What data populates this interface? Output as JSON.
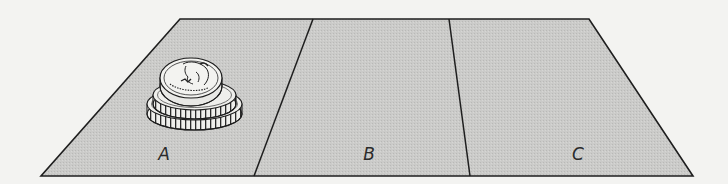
{
  "figure": {
    "colors": {
      "background": "#f3f3f1",
      "mat_fill": "#c9c9c7",
      "outline": "#1e1e1e",
      "coin_face": "#f2f2ef",
      "coin_edge": "#e6e6e2"
    },
    "regions": [
      {
        "id": "A",
        "label": "A",
        "has_coins": true
      },
      {
        "id": "B",
        "label": "B",
        "has_coins": false
      },
      {
        "id": "C",
        "label": "C",
        "has_coins": false
      }
    ],
    "coin_stack": {
      "location": "A",
      "count": 3,
      "top_coin": "quarter"
    }
  }
}
